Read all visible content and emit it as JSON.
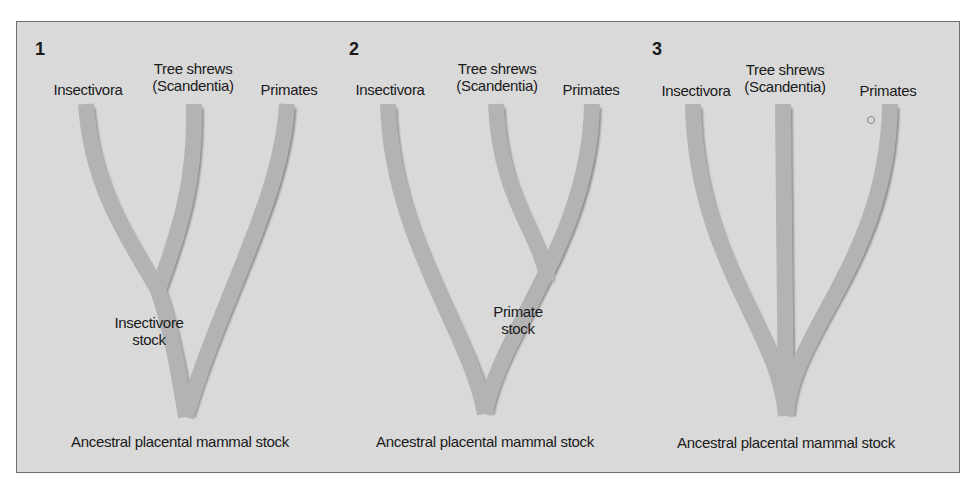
{
  "colors": {
    "background": "#d9d9d9",
    "branch": "#b3b3b3",
    "branch_shadow": "#8a8a8a",
    "border": "#6e6e6e",
    "text": "#1a1a1a"
  },
  "panels": [
    {
      "number": "1",
      "taxa": {
        "left": "Insectivora",
        "middle_line1": "Tree shrews",
        "middle_line2": "(Scandentia)",
        "right": "Primates"
      },
      "node_label_line1": "Insectivore",
      "node_label_line2": "stock",
      "root_label": "Ancestral placental mammal stock"
    },
    {
      "number": "2",
      "taxa": {
        "left": "Insectivora",
        "middle_line1": "Tree shrews",
        "middle_line2": "(Scandentia)",
        "right": "Primates"
      },
      "node_label_line1": "Primate",
      "node_label_line2": "stock",
      "root_label": "Ancestral placental mammal stock"
    },
    {
      "number": "3",
      "taxa": {
        "left": "Insectivora",
        "middle_line1": "Tree shrews",
        "middle_line2": "(Scandentia)",
        "right": "Primates"
      },
      "node_label_line1": "",
      "node_label_line2": "",
      "root_label": "Ancestral placental mammal stock"
    }
  ]
}
